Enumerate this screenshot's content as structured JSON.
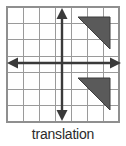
{
  "figure": {
    "caption": "translation",
    "type": "coordinate-grid-diagram",
    "background_color": "#ffffff"
  },
  "grid": {
    "columns": 7,
    "rows": 7,
    "left": 7,
    "top": 7,
    "right": 119,
    "bottom": 122,
    "cell_width": 16,
    "cell_height": 16.4,
    "line_color": "#9a9a9a",
    "border_color": "#8f8f8f",
    "line_width": 1
  },
  "axes": {
    "color": "#3a3a3a",
    "line_width": 2.4,
    "origin_x": 62,
    "origin_y": 63,
    "x_axis": {
      "name": "horizontal-axis",
      "from_x": 9,
      "to_x": 121,
      "y": 63,
      "arrow_left": true,
      "arrow_right": true
    },
    "y_axis": {
      "name": "vertical-axis",
      "x": 62,
      "from_y": 9,
      "to_y": 120,
      "arrow_up": true,
      "arrow_down": true
    }
  },
  "shapes": [
    {
      "name": "upper-triangle",
      "label": "pre-image",
      "fill": "#5a5a5a",
      "stroke": "#3d3d3d",
      "points": "78,17 110,17 110,49"
    },
    {
      "name": "lower-triangle",
      "label": "image",
      "fill": "#5a5a5a",
      "stroke": "#3d3d3d",
      "points": "78,78 110,78 110,110"
    }
  ],
  "chart_data": {
    "type": "scatter",
    "title": "translation",
    "xlabel": "",
    "ylabel": "",
    "xlim": [
      -4,
      4
    ],
    "ylim": [
      -4,
      4
    ],
    "grid": true,
    "legend": null,
    "series": [
      {
        "name": "pre-image triangle",
        "vertices": [
          [
            1,
            3
          ],
          [
            3,
            3
          ],
          [
            3,
            1
          ]
        ]
      },
      {
        "name": "image triangle",
        "vertices": [
          [
            1,
            -1
          ],
          [
            3,
            -1
          ],
          [
            3,
            -3
          ]
        ]
      }
    ],
    "annotations": [
      "translation"
    ]
  }
}
